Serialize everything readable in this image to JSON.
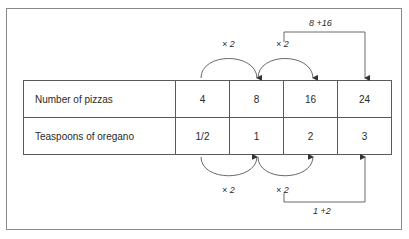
{
  "table": {
    "rows": [
      {
        "label": "Number of pizzas",
        "values": [
          "4",
          "8",
          "16",
          "24"
        ]
      },
      {
        "label": "Teaspoons of oregano",
        "values": [
          "1/2",
          "1",
          "2",
          "3"
        ]
      }
    ]
  },
  "annotations": {
    "top_arc_1": "× 2",
    "top_arc_2": "× 2",
    "top_bracket": "8 +16",
    "bottom_arc_1": "× 2",
    "bottom_arc_2": "× 2",
    "bottom_bracket": "1 +2"
  }
}
